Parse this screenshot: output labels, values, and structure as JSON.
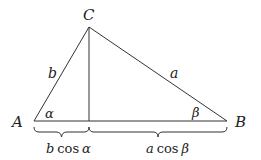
{
  "diagram": {
    "vertices": {
      "A": "A",
      "B": "B",
      "C": "C"
    },
    "sides": {
      "b": "b",
      "a": "a"
    },
    "angles": {
      "alpha": "α",
      "beta": "β"
    },
    "segments": {
      "left": {
        "coef": "b",
        "fn": "cos",
        "angle": "α"
      },
      "right": {
        "coef": "a",
        "fn": "cos",
        "angle": "β"
      }
    },
    "colors": {
      "line": "#333333",
      "text": "#222222",
      "background": "#ffffff"
    }
  }
}
